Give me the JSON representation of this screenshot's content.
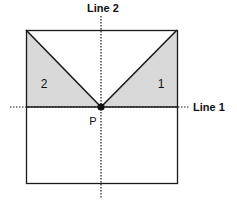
{
  "labels": {
    "line1": "Line 1",
    "line2": "Line 2",
    "point": "P",
    "region1": "1",
    "region2": "2"
  },
  "colors": {
    "shade": "#d9d9d9",
    "stroke": "#1a1a1a"
  }
}
